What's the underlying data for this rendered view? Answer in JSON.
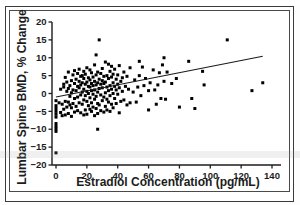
{
  "figure": {
    "background_color": "#ffffff",
    "frame_color": "#3a3a3a",
    "marker_color": "#000000",
    "line_color": "#1a1a1a"
  },
  "chart_data": {
    "type": "scatter",
    "title": "",
    "xlabel": "Estradiol Concentration (pg/mL)",
    "ylabel": "Lumbar Spine BMD, % Change",
    "xlim": [
      -5,
      140
    ],
    "ylim": [
      -20,
      20
    ],
    "xticks": [
      0,
      20,
      40,
      60,
      80,
      100,
      120,
      140
    ],
    "xtick_labels": [
      "0",
      "20",
      "40",
      "60",
      "80",
      "100",
      "120",
      "140"
    ],
    "yticks": [
      -20,
      -15,
      -10,
      -5,
      0,
      5,
      10,
      15,
      20
    ],
    "ytick_labels": [
      "−20",
      "−15",
      "−10",
      "−5",
      "0",
      "5",
      "10",
      "15",
      "20"
    ],
    "grid": false,
    "legend": null,
    "trendline": {
      "label": "linear regression",
      "x_start": 0,
      "y_start": -1.0,
      "x_end": 134,
      "y_end": 10.4
    },
    "points": [
      [
        0,
        -4.2
      ],
      [
        0,
        -5.0
      ],
      [
        0,
        -5.8
      ],
      [
        0,
        -6.6
      ],
      [
        0,
        -8.4
      ],
      [
        0,
        -9.2
      ],
      [
        0,
        -9.9
      ],
      [
        0,
        -10.6
      ],
      [
        0,
        -16.6
      ],
      [
        0,
        -3.4
      ],
      [
        0,
        -2.0
      ],
      [
        2,
        -2.6
      ],
      [
        3,
        -5.3
      ],
      [
        3,
        1.2
      ],
      [
        4,
        -3.0
      ],
      [
        4,
        -6.2
      ],
      [
        5,
        1.8
      ],
      [
        5,
        -4.4
      ],
      [
        5,
        2.6
      ],
      [
        6,
        -2.2
      ],
      [
        6,
        -6.0
      ],
      [
        6,
        4.5
      ],
      [
        7,
        -3.8
      ],
      [
        7,
        0.6
      ],
      [
        7,
        3.2
      ],
      [
        8,
        -5.6
      ],
      [
        8,
        -2.4
      ],
      [
        8,
        1.4
      ],
      [
        8,
        6.0
      ],
      [
        9,
        -3.2
      ],
      [
        9,
        -0.8
      ],
      [
        9,
        2.2
      ],
      [
        10,
        -6.4
      ],
      [
        10,
        -4.0
      ],
      [
        10,
        0.2
      ],
      [
        10,
        3.6
      ],
      [
        11,
        -2.8
      ],
      [
        11,
        5.2
      ],
      [
        11,
        1.0
      ],
      [
        12,
        -5.2
      ],
      [
        12,
        -1.4
      ],
      [
        12,
        2.8
      ],
      [
        12,
        6.4
      ],
      [
        13,
        -3.6
      ],
      [
        13,
        0.8
      ],
      [
        13,
        4.0
      ],
      [
        14,
        -4.8
      ],
      [
        14,
        -1.0
      ],
      [
        14,
        2.0
      ],
      [
        14,
        5.6
      ],
      [
        15,
        -2.6
      ],
      [
        15,
        1.6
      ],
      [
        15,
        3.4
      ],
      [
        15,
        6.8
      ],
      [
        16,
        -5.4
      ],
      [
        16,
        -0.4
      ],
      [
        16,
        2.4
      ],
      [
        16,
        4.8
      ],
      [
        17,
        -3.0
      ],
      [
        17,
        0.4
      ],
      [
        17,
        3.0
      ],
      [
        17,
        5.0
      ],
      [
        18,
        -6.0
      ],
      [
        18,
        -1.8
      ],
      [
        18,
        1.2
      ],
      [
        18,
        4.2
      ],
      [
        18,
        6.2
      ],
      [
        19,
        -4.6
      ],
      [
        19,
        -0.6
      ],
      [
        19,
        2.6
      ],
      [
        19,
        5.4
      ],
      [
        20,
        -5.8
      ],
      [
        20,
        -2.2
      ],
      [
        20,
        0.6
      ],
      [
        20,
        3.2
      ],
      [
        20,
        7.2
      ],
      [
        21,
        -3.4
      ],
      [
        21,
        0.0
      ],
      [
        21,
        2.0
      ],
      [
        21,
        4.4
      ],
      [
        22,
        -4.4
      ],
      [
        22,
        -1.2
      ],
      [
        22,
        1.8
      ],
      [
        22,
        3.8
      ],
      [
        22,
        6.6
      ],
      [
        23,
        -5.0
      ],
      [
        23,
        -2.6
      ],
      [
        23,
        0.8
      ],
      [
        23,
        2.8
      ],
      [
        23,
        5.8
      ],
      [
        24,
        -3.8
      ],
      [
        24,
        -0.2
      ],
      [
        24,
        2.2
      ],
      [
        24,
        4.6
      ],
      [
        25,
        -6.2
      ],
      [
        25,
        -1.6
      ],
      [
        25,
        1.0
      ],
      [
        25,
        3.4
      ],
      [
        25,
        8.0
      ],
      [
        26,
        -4.2
      ],
      [
        26,
        -0.8
      ],
      [
        26,
        2.4
      ],
      [
        26,
        5.2
      ],
      [
        26,
        10.8
      ],
      [
        27,
        -5.6
      ],
      [
        27,
        -2.8
      ],
      [
        27,
        0.4
      ],
      [
        27,
        3.0
      ],
      [
        27,
        6.0
      ],
      [
        27,
        -10.0
      ],
      [
        28,
        -3.2
      ],
      [
        28,
        1.4
      ],
      [
        28,
        4.0
      ],
      [
        28,
        15.0
      ],
      [
        29,
        -4.8
      ],
      [
        29,
        -0.4
      ],
      [
        29,
        2.6
      ],
      [
        29,
        5.6
      ],
      [
        30,
        -2.0
      ],
      [
        30,
        1.6
      ],
      [
        30,
        3.6
      ],
      [
        30,
        7.0
      ],
      [
        31,
        -5.2
      ],
      [
        31,
        -1.0
      ],
      [
        31,
        2.8
      ],
      [
        31,
        4.8
      ],
      [
        32,
        -3.6
      ],
      [
        32,
        0.2
      ],
      [
        32,
        3.2
      ],
      [
        32,
        8.8
      ],
      [
        33,
        -4.6
      ],
      [
        33,
        -1.6
      ],
      [
        33,
        1.8
      ],
      [
        33,
        5.0
      ],
      [
        34,
        -2.4
      ],
      [
        34,
        0.8
      ],
      [
        34,
        4.2
      ],
      [
        34,
        8.2
      ],
      [
        35,
        -5.0
      ],
      [
        35,
        -0.6
      ],
      [
        35,
        2.2
      ],
      [
        35,
        6.2
      ],
      [
        36,
        -3.0
      ],
      [
        36,
        1.2
      ],
      [
        36,
        4.6
      ],
      [
        36,
        7.6
      ],
      [
        37,
        -4.0
      ],
      [
        37,
        0.0
      ],
      [
        37,
        3.0
      ],
      [
        37,
        5.4
      ],
      [
        38,
        -1.4
      ],
      [
        38,
        2.0
      ],
      [
        38,
        6.8
      ],
      [
        39,
        -2.8
      ],
      [
        39,
        1.0
      ],
      [
        39,
        4.0
      ],
      [
        40,
        -0.2
      ],
      [
        40,
        2.6
      ],
      [
        40,
        5.2
      ],
      [
        41,
        -5.4
      ],
      [
        41,
        1.6
      ],
      [
        41,
        7.8
      ],
      [
        42,
        -2.2
      ],
      [
        42,
        3.4
      ],
      [
        43,
        0.6
      ],
      [
        43,
        4.4
      ],
      [
        44,
        -1.8
      ],
      [
        44,
        6.0
      ],
      [
        45,
        2.0
      ],
      [
        46,
        -3.2
      ],
      [
        46,
        4.8
      ],
      [
        47,
        1.2
      ],
      [
        48,
        -2.6
      ],
      [
        48,
        7.2
      ],
      [
        50,
        0.4
      ],
      [
        51,
        3.8
      ],
      [
        52,
        -2.4
      ],
      [
        53,
        1.8
      ],
      [
        54,
        9.0
      ],
      [
        54,
        5.0
      ],
      [
        55,
        -0.6
      ],
      [
        56,
        7.4
      ],
      [
        57,
        2.2
      ],
      [
        58,
        4.2
      ],
      [
        60,
        -4.6
      ],
      [
        60,
        0.8
      ],
      [
        61,
        3.0
      ],
      [
        63,
        6.6
      ],
      [
        64,
        1.0
      ],
      [
        65,
        -3.0
      ],
      [
        66,
        2.4
      ],
      [
        67,
        5.8
      ],
      [
        68,
        -1.4
      ],
      [
        69,
        8.0
      ],
      [
        70,
        3.4
      ],
      [
        70,
        10.0
      ],
      [
        71,
        -1.6
      ],
      [
        72,
        6.0
      ],
      [
        75,
        2.8
      ],
      [
        78,
        4.2
      ],
      [
        80,
        -3.8
      ],
      [
        86,
        9.0
      ],
      [
        88,
        -1.4
      ],
      [
        90,
        -4.2
      ],
      [
        95,
        6.2
      ],
      [
        96,
        2.4
      ],
      [
        111,
        15.0
      ],
      [
        127,
        0.8
      ],
      [
        134,
        3.0
      ]
    ]
  }
}
